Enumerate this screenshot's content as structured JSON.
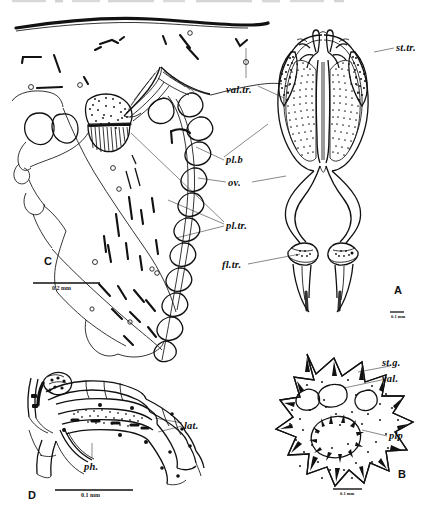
{
  "figure": {
    "type": "scientific-plate",
    "background_color": "#ffffff",
    "ink_color": "#111111"
  },
  "panels": [
    {
      "id": "A",
      "letter": "A",
      "caption_letter_position": "bottom-right",
      "scale_bar": {
        "label": "0.1 mm",
        "position": "below-letter"
      },
      "labels": [
        {
          "key": "st_tr",
          "text": "st.tr.",
          "meaning": "stigmatic trachea",
          "side": "right"
        },
        {
          "key": "val_tr",
          "text": "val.tr.",
          "meaning": "valve trachea",
          "side": "left"
        },
        {
          "key": "fl_tr",
          "text": "fl.tr.",
          "meaning": "flagellar trachea",
          "side": "left"
        }
      ]
    },
    {
      "id": "B",
      "letter": "B",
      "caption_letter_position": "bottom-right",
      "scale_bar": {
        "label": "0.1 mm",
        "position": "bottom-center"
      },
      "labels": [
        {
          "key": "st_g",
          "text": "st.g.",
          "meaning": "stigmatic groove",
          "side": "right"
        },
        {
          "key": "val",
          "text": "val.",
          "meaning": "valve",
          "side": "right"
        },
        {
          "key": "plp",
          "text": "plp",
          "meaning": "palp",
          "side": "right"
        }
      ]
    },
    {
      "id": "C",
      "letter": "C",
      "caption_letter_position": "mid-left",
      "scale_bar": {
        "label": "0.2 mm",
        "position": "below-letter"
      },
      "labels": [
        {
          "key": "pl_b",
          "text": "pl.b",
          "meaning": "pleural body",
          "side": "right"
        },
        {
          "key": "ov",
          "text": "ov.",
          "meaning": "ovary",
          "side": "right"
        },
        {
          "key": "pl_tr",
          "text": "pl.tr.",
          "meaning": "pleural trachea",
          "side": "right"
        }
      ]
    },
    {
      "id": "D",
      "letter": "D",
      "caption_letter_position": "bottom-left",
      "scale_bar": {
        "label": "0.1 mm",
        "position": "bottom-center"
      },
      "labels": [
        {
          "key": "lat",
          "text": "lat.",
          "meaning": "lateral apodeme",
          "side": "right"
        },
        {
          "key": "ph",
          "text": "ph.",
          "meaning": "pharynx",
          "side": "below-center"
        }
      ]
    }
  ],
  "all_label_texts": [
    "st.tr.",
    "val.tr.",
    "pl.b",
    "ov.",
    "pl.tr.",
    "fl.tr.",
    "st.g.",
    "val.",
    "plp",
    "lat.",
    "ph.",
    "A",
    "B",
    "C",
    "D"
  ],
  "scale_bars": [
    {
      "panel": "C",
      "label": "0.2 mm"
    },
    {
      "panel": "A",
      "label": "0.1 mm"
    },
    {
      "panel": "D",
      "label": "0.1 mm"
    },
    {
      "panel": "B",
      "label": "0.1 mm"
    }
  ]
}
